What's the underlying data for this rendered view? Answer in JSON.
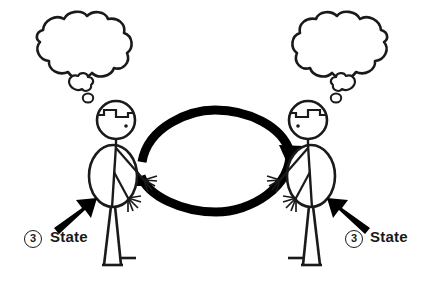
{
  "diagram": {
    "background_color": "#ffffff",
    "ink_color": "#1a1a1a",
    "annotations": [
      {
        "id": "left",
        "number": "3",
        "label": "State",
        "arrow_direction": "up-right",
        "points_at": "left-person-torso"
      },
      {
        "id": "right",
        "number": "3",
        "label": "State",
        "arrow_direction": "up-left",
        "points_at": "right-person-torso"
      }
    ],
    "people": [
      {
        "id": "left-person",
        "facing": "right",
        "thought_bubble": {
          "content": "",
          "empty": true,
          "position": "upper-left"
        }
      },
      {
        "id": "right-person",
        "facing": "left",
        "thought_bubble": {
          "content": "",
          "empty": true,
          "position": "upper-right"
        }
      }
    ],
    "cycle": {
      "type": "bidirectional-loop",
      "top_arc_direction": "left-to-right",
      "bottom_arc_direction": "right-to-left"
    }
  }
}
